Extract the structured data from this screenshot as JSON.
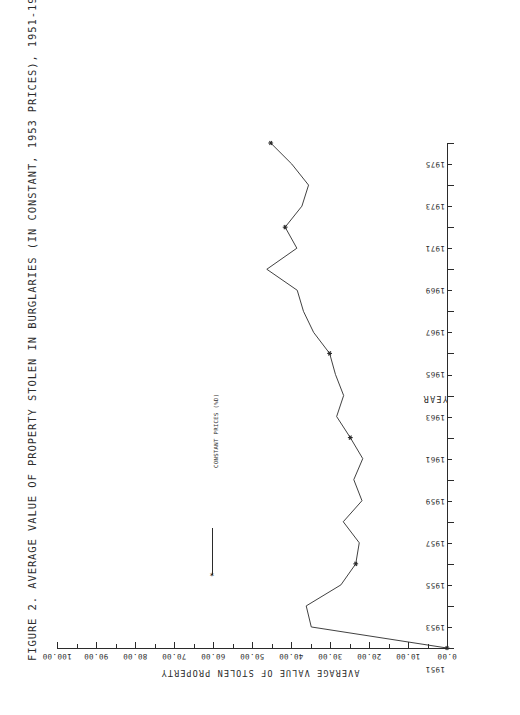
{
  "figure": {
    "title": "FIGURE 2. AVERAGE VALUE OF PROPERTY STOLEN IN BURGLARIES (IN CONSTANT, 1953 PRICES), 1951-1975",
    "orientation_note": "180-degree-rotated-plot",
    "line_color": "#2b2b2b",
    "background_color": "#ffffff"
  },
  "legend": {
    "entry_label": "CONSTANT PRICES (%D)",
    "marker_glyph": "✶"
  },
  "chart_data": {
    "type": "line",
    "title": "FIGURE 2. AVERAGE VALUE OF PROPERTY STOLEN IN BURGLARIES (IN CONSTANT, 1953 PRICES), 1951-1975",
    "xlabel": "YEAR",
    "ylabel": "AVERAGE VALUE OF STOLEN PROPERTY",
    "xlim": [
      1951,
      1975
    ],
    "ylim": [
      0.0,
      100.0
    ],
    "grid": false,
    "legend_position": "center-left",
    "x_tick_labels": [
      "1951",
      "1953",
      "1955",
      "1957",
      "1959",
      "1961",
      "1963",
      "1965",
      "1967",
      "1969",
      "1971",
      "1973",
      "1975"
    ],
    "x_ticks": [
      1951,
      1953,
      1955,
      1957,
      1959,
      1961,
      1963,
      1965,
      1967,
      1969,
      1971,
      1973,
      1975
    ],
    "x_minor_ticks": [
      1952,
      1954,
      1956,
      1958,
      1960,
      1962,
      1964,
      1966,
      1968,
      1970,
      1972,
      1974
    ],
    "y_tick_labels": [
      "0.00",
      "10.00",
      "20.00",
      "30.00",
      "40.00",
      "50.00",
      "60.00",
      "70.00",
      "80.00",
      "90.00",
      "100.00"
    ],
    "y_ticks": [
      0.0,
      10.0,
      20.0,
      30.0,
      40.0,
      50.0,
      60.0,
      70.0,
      80.0,
      90.0,
      100.0
    ],
    "y_minor_ticks": [
      5.0,
      15.0,
      25.0,
      35.0,
      45.0,
      55.0,
      65.0,
      75.0,
      85.0,
      95.0
    ],
    "series": [
      {
        "name": "CONSTANT PRICES (%D)",
        "x": [
          1951,
          1952,
          1953,
          1954,
          1955,
          1956,
          1957,
          1958,
          1959,
          1960,
          1961,
          1962,
          1963,
          1964,
          1965,
          1966,
          1967,
          1968,
          1969,
          1970,
          1971,
          1972,
          1973,
          1974,
          1975
        ],
        "values": [
          0.0,
          34.8,
          36.1,
          27.2,
          23.4,
          22.5,
          26.6,
          21.8,
          23.9,
          21.6,
          24.8,
          28.3,
          26.5,
          28.6,
          30.1,
          34.2,
          36.8,
          38.4,
          46.2,
          38.5,
          41.5,
          37.2,
          35.5,
          39.8,
          45.2
        ],
        "marked_points": [
          {
            "x": 1951,
            "value": 0.0
          },
          {
            "x": 1955,
            "value": 23.4
          },
          {
            "x": 1961,
            "value": 24.8
          },
          {
            "x": 1965,
            "value": 30.1
          },
          {
            "x": 1971,
            "value": 41.5
          },
          {
            "x": 1975,
            "value": 45.2
          }
        ]
      }
    ]
  }
}
